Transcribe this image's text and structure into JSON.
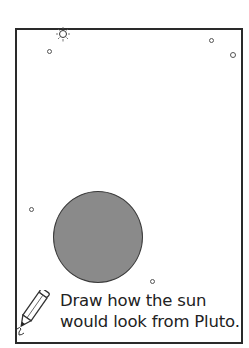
{
  "worksheet": {
    "instruction_line1": "Draw how the sun",
    "instruction_line2": "would look from Pluto.",
    "icons": {
      "small_sun": "sun-icon",
      "pencil": "pencil-icon"
    },
    "colors": {
      "frame": "#2a2a2a",
      "sun_fill": "#8a8a8a",
      "text": "#222222"
    }
  }
}
